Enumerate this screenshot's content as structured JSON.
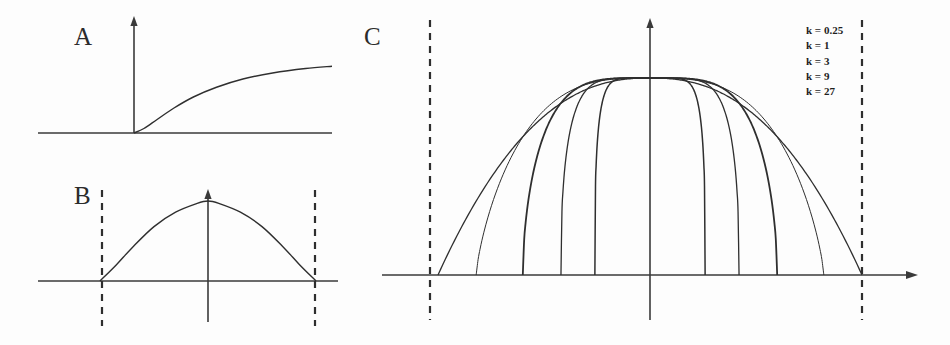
{
  "figure": {
    "background_color": "#fdfdfd",
    "ink_color": "#2f2f2f",
    "width": 950,
    "height": 345
  },
  "panels": [
    {
      "id": "A",
      "label": "A",
      "description": "monotonic saturating curve rising from origin"
    },
    {
      "id": "B",
      "label": "B",
      "description": "symmetric dome curve bounded by dashed limits"
    },
    {
      "id": "C",
      "label": "C",
      "description": "family of five symmetric bell curves with shared peak"
    }
  ],
  "legend": {
    "entries": [
      {
        "label": "k = 0.25",
        "k": 0.25
      },
      {
        "label": "k = 1",
        "k": 1
      },
      {
        "label": "k = 3",
        "k": 3
      },
      {
        "label": "k = 9",
        "k": 9
      },
      {
        "label": "k = 27",
        "k": 27
      }
    ]
  },
  "chart_data": [
    {
      "id": "panel-a",
      "type": "line",
      "title": "A",
      "xlabel": "",
      "ylabel": "",
      "xlim": [
        -1,
        3
      ],
      "ylim": [
        0,
        1
      ],
      "grid": false,
      "legend_position": "none",
      "series": [
        {
          "name": "saturating response",
          "x": [
            -1,
            -0.5,
            0,
            0.15,
            0.35,
            0.6,
            0.9,
            1.25,
            1.65,
            2.1,
            2.6,
            3
          ],
          "y": [
            0,
            0,
            0,
            0.06,
            0.18,
            0.33,
            0.48,
            0.61,
            0.72,
            0.8,
            0.86,
            0.89
          ]
        }
      ]
    },
    {
      "id": "panel-b",
      "type": "line",
      "title": "B",
      "xlabel": "",
      "ylabel": "",
      "xlim": [
        -1.35,
        1.35
      ],
      "ylim": [
        0,
        1
      ],
      "grid": false,
      "legend_position": "none",
      "boundaries": [
        -1.35,
        1.35
      ],
      "series": [
        {
          "name": "dome",
          "x": [
            -1.0,
            -0.85,
            -0.7,
            -0.5,
            -0.3,
            -0.1,
            0,
            0.1,
            0.3,
            0.5,
            0.7,
            0.85,
            1.0
          ],
          "y": [
            0,
            0.2,
            0.42,
            0.68,
            0.86,
            0.97,
            1.0,
            0.97,
            0.86,
            0.68,
            0.42,
            0.2,
            0
          ]
        }
      ]
    },
    {
      "id": "panel-c",
      "type": "line",
      "title": "C",
      "xlabel": "",
      "ylabel": "",
      "xlim": [
        -1.3,
        1.3
      ],
      "ylim": [
        0,
        1
      ],
      "grid": false,
      "legend_position": "top-right",
      "boundaries": [
        -1.0,
        1.0
      ],
      "categories": [
        "k = 0.25",
        "k = 1",
        "k = 3",
        "k = 9",
        "k = 27"
      ],
      "series": [
        {
          "name": "k = 0.25",
          "k": 0.25,
          "half_width": 1.0,
          "peak": 1.0,
          "linewidth": 1.3
        },
        {
          "name": "k = 1",
          "k": 1,
          "half_width": 0.82,
          "peak": 1.0,
          "linewidth": 1.0
        },
        {
          "name": "k = 3",
          "k": 3,
          "half_width": 0.6,
          "peak": 1.0,
          "linewidth": 1.8
        },
        {
          "name": "k = 9",
          "k": 9,
          "half_width": 0.42,
          "peak": 1.0,
          "linewidth": 1.3
        },
        {
          "name": "k = 27",
          "k": 27,
          "half_width": 0.26,
          "peak": 1.0,
          "linewidth": 1.5
        }
      ]
    }
  ]
}
